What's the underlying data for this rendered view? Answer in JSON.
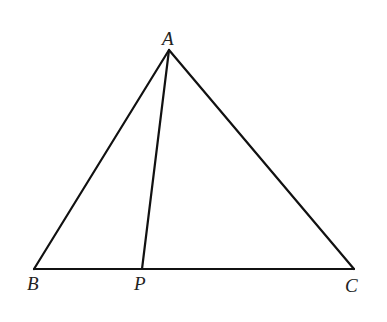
{
  "diagram": {
    "type": "triangle",
    "points": {
      "A": {
        "label": "A",
        "x": 169,
        "y": 50
      },
      "B": {
        "label": "B",
        "x": 34,
        "y": 269
      },
      "C": {
        "label": "C",
        "x": 354,
        "y": 269
      },
      "P": {
        "label": "P",
        "x": 142,
        "y": 269
      }
    },
    "segments": [
      "AB",
      "AC",
      "BC",
      "AP"
    ],
    "stroke_color": "#111111"
  }
}
